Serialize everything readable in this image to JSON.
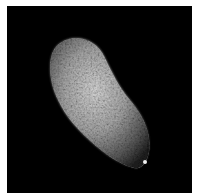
{
  "image": {
    "subject": "seed-micrograph",
    "background_color": "#000000",
    "border_color": "#ffffff",
    "object_colors": {
      "highlight": "#e8e8e8",
      "mid": "#9a9a9a",
      "shadow": "#3a3a3a"
    }
  }
}
